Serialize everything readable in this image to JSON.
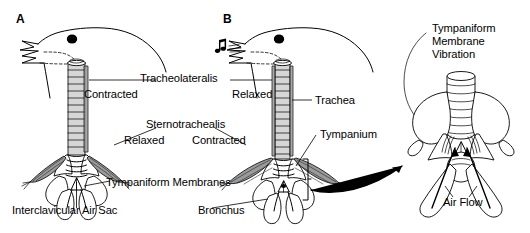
{
  "figure": {
    "width": 530,
    "height": 233,
    "background_color": "#ffffff",
    "ink_color": "#000000",
    "muscle_shading_color": "#9a9a9a"
  },
  "panels": [
    {
      "id": "A",
      "letter": "A",
      "caption": "Bird not singing: tracheolateralis contracted, sternotrachealis relaxed",
      "beak_state": "open, silent"
    },
    {
      "id": "B",
      "letter": "B",
      "caption": "Bird singing: tracheolateralis relaxed, sternotrachealis contracted",
      "beak_state": "open, sound emitted"
    },
    {
      "id": "C",
      "letter": "",
      "caption": "Magnified syrinx showing tympaniform membrane vibration and air flow"
    }
  ],
  "labels": {
    "tracheolateralis": "Tracheolateralis",
    "contracted_a": "Contracted",
    "relaxed_b": "Relaxed",
    "trachea": "Trachea",
    "sternotrachealis": "Sternotrachealis",
    "relaxed_a": "Relaxed",
    "contracted_b": "Contracted",
    "tympanium": "Tympanium",
    "tympaniform_membranes": "Tympaniform Membranes",
    "interclavicular_air_sac": "Interclavicular Air Sac",
    "bronchus": "Bronchus",
    "tympaniform_membrane_vibration_line1": "Tympaniform",
    "tympaniform_membrane_vibration_line2": "Membrane",
    "tympaniform_membrane_vibration_line3": "Vibration",
    "air_flow": "Air Flow"
  },
  "icons": {
    "music_note": "music-note-icon",
    "sound_waves": "sound-wave-icon",
    "eye": "bird-eye-icon",
    "transition_arrow": "curved-arrow-icon",
    "air_flow_arrows": "airflow-arrow-icon"
  }
}
